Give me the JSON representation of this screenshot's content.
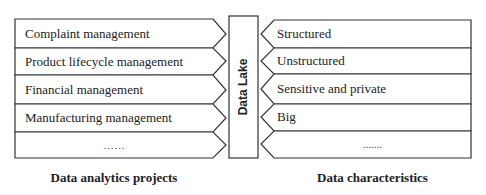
{
  "diagram": {
    "center": {
      "label": "Data Lake"
    },
    "left": {
      "caption": "Data analytics projects",
      "items": [
        {
          "label": "Complaint management"
        },
        {
          "label": "Product lifecycle management"
        },
        {
          "label": "Financial management"
        },
        {
          "label": "Manufacturing management"
        },
        {
          "label": "……"
        }
      ]
    },
    "right": {
      "caption": "Data characteristics",
      "items": [
        {
          "label": "Structured"
        },
        {
          "label": "Unstructured"
        },
        {
          "label": "Sensitive and private"
        },
        {
          "label": "Big"
        },
        {
          "label": "......."
        }
      ]
    },
    "colors": {
      "stroke": "#333333",
      "background": "#ffffff",
      "text": "#222222"
    }
  }
}
